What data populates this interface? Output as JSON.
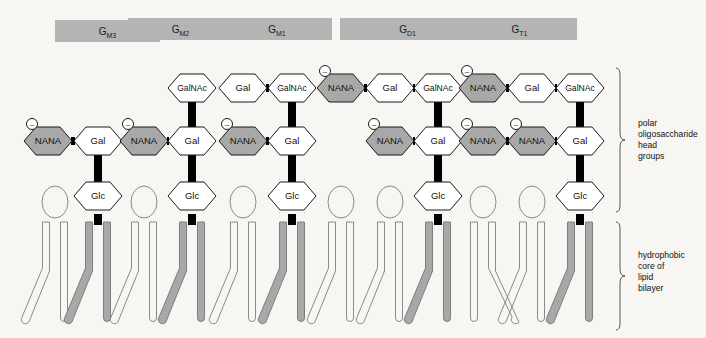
{
  "figure": {
    "background_color": "#f7f6f3"
  },
  "colors": {
    "header_bar_fill": "#b4b4b4",
    "nana_fill": "#a8a8a8",
    "sugar_fill": "#ffffff",
    "outline": "#1a1a1a",
    "bond_fill": "#000000",
    "ganglioside_tail_fill": "#a8a8a8",
    "phospholipid_outline": "#8a8a8a",
    "bracket_color": "#555555"
  },
  "header_bars": [
    {
      "name": "G",
      "subscript": "M3",
      "x": 55,
      "y": 20,
      "width": 105,
      "height": 22
    },
    {
      "name": "G",
      "subscript": "M2",
      "x": 128,
      "y": 18,
      "width": 105,
      "height": 22
    },
    {
      "name": "G",
      "subscript": "M1",
      "x": 222,
      "y": 18,
      "width": 110,
      "height": 22
    },
    {
      "name": "G",
      "subscript": "D1",
      "x": 340,
      "y": 18,
      "width": 135,
      "height": 22
    },
    {
      "name": "G",
      "subscript": "T1",
      "x": 462,
      "y": 18,
      "width": 115,
      "height": 22
    }
  ],
  "sugar_labels": {
    "nana": "NANA",
    "gal": "Gal",
    "galnac": "GalNAc",
    "glc": "Glc"
  },
  "charge_symbol": "–",
  "gangliosides": [
    {
      "id": "GM3",
      "label": "G",
      "subscript": "M3",
      "column_x": 60,
      "residues": [
        {
          "type": "nana",
          "label": "NANA",
          "cx": 48,
          "cy": 141,
          "charged": true
        },
        {
          "type": "gal",
          "label": "Gal",
          "cx": 98,
          "cy": 141,
          "charged": false
        },
        {
          "type": "glc",
          "label": "Glc",
          "cx": 98,
          "cy": 196,
          "charged": false
        }
      ],
      "bonds": [
        {
          "type": "horizontal",
          "x1": 48,
          "y1": 141,
          "x2": 98,
          "y2": 141
        },
        {
          "type": "vertical",
          "x1": 98,
          "y1": 141,
          "x2": 98,
          "y2": 196
        }
      ]
    },
    {
      "id": "GM2",
      "label": "G",
      "subscript": "M2",
      "column_x": 152,
      "residues": [
        {
          "type": "galnac",
          "label": "GalNAc",
          "cx": 192,
          "cy": 88,
          "charged": false
        },
        {
          "type": "nana",
          "label": "NANA",
          "cx": 144,
          "cy": 141,
          "charged": true
        },
        {
          "type": "gal",
          "label": "Gal",
          "cx": 192,
          "cy": 141,
          "charged": false
        },
        {
          "type": "glc",
          "label": "Glc",
          "cx": 192,
          "cy": 196,
          "charged": false
        }
      ],
      "bonds": [
        {
          "type": "vertical",
          "x1": 192,
          "y1": 88,
          "x2": 192,
          "y2": 141
        },
        {
          "type": "horizontal",
          "x1": 144,
          "y1": 141,
          "x2": 192,
          "y2": 141
        },
        {
          "type": "vertical",
          "x1": 192,
          "y1": 141,
          "x2": 192,
          "y2": 196
        }
      ]
    },
    {
      "id": "GM1",
      "label": "G",
      "subscript": "M1",
      "column_x": 245,
      "residues": [
        {
          "type": "gal",
          "label": "Gal",
          "cx": 243,
          "cy": 88,
          "charged": false
        },
        {
          "type": "galnac",
          "label": "GalNAc",
          "cx": 292,
          "cy": 88,
          "charged": false
        },
        {
          "type": "nana",
          "label": "NANA",
          "cx": 243,
          "cy": 141,
          "charged": true
        },
        {
          "type": "gal",
          "label": "Gal",
          "cx": 292,
          "cy": 141,
          "charged": false
        },
        {
          "type": "glc",
          "label": "Glc",
          "cx": 292,
          "cy": 196,
          "charged": false
        }
      ],
      "bonds": [
        {
          "type": "horizontal",
          "x1": 243,
          "y1": 88,
          "x2": 292,
          "y2": 88
        },
        {
          "type": "vertical",
          "x1": 292,
          "y1": 88,
          "x2": 292,
          "y2": 141
        },
        {
          "type": "horizontal",
          "x1": 243,
          "y1": 141,
          "x2": 292,
          "y2": 141
        },
        {
          "type": "vertical",
          "x1": 292,
          "y1": 141,
          "x2": 292,
          "y2": 196
        }
      ]
    },
    {
      "id": "GD1",
      "label": "G",
      "subscript": "D1",
      "column_x": 345,
      "residues": [
        {
          "type": "nana",
          "label": "NANA",
          "cx": 341,
          "cy": 88,
          "charged": true
        },
        {
          "type": "gal",
          "label": "Gal",
          "cx": 390,
          "cy": 88,
          "charged": false
        },
        {
          "type": "galnac",
          "label": "GalNAc",
          "cx": 438,
          "cy": 88,
          "charged": false
        },
        {
          "type": "nana",
          "label": "NANA",
          "cx": 390,
          "cy": 141,
          "charged": true
        },
        {
          "type": "gal",
          "label": "Gal",
          "cx": 438,
          "cy": 141,
          "charged": false
        },
        {
          "type": "glc",
          "label": "Glc",
          "cx": 438,
          "cy": 196,
          "charged": false
        }
      ],
      "bonds": [
        {
          "type": "horizontal",
          "x1": 341,
          "y1": 88,
          "x2": 390,
          "y2": 88
        },
        {
          "type": "horizontal",
          "x1": 390,
          "y1": 88,
          "x2": 438,
          "y2": 88
        },
        {
          "type": "vertical",
          "x1": 438,
          "y1": 88,
          "x2": 438,
          "y2": 141
        },
        {
          "type": "horizontal",
          "x1": 390,
          "y1": 141,
          "x2": 438,
          "y2": 141
        },
        {
          "type": "vertical",
          "x1": 438,
          "y1": 141,
          "x2": 438,
          "y2": 196
        }
      ]
    },
    {
      "id": "GT1",
      "label": "G",
      "subscript": "T1",
      "column_x": 465,
      "residues": [
        {
          "type": "nana",
          "label": "NANA",
          "cx": 483,
          "cy": 88,
          "charged": true
        },
        {
          "type": "gal",
          "label": "Gal",
          "cx": 532,
          "cy": 88,
          "charged": false
        },
        {
          "type": "galnac",
          "label": "GalNAc",
          "cx": 580,
          "cy": 88,
          "charged": false
        },
        {
          "type": "nana",
          "label": "NANA",
          "cx": 483,
          "cy": 141,
          "charged": true
        },
        {
          "type": "nana",
          "label": "NANA",
          "cx": 532,
          "cy": 141,
          "charged": true
        },
        {
          "type": "gal",
          "label": "Gal",
          "cx": 580,
          "cy": 141,
          "charged": false
        },
        {
          "type": "glc",
          "label": "Glc",
          "cx": 580,
          "cy": 196,
          "charged": false
        }
      ],
      "bonds": [
        {
          "type": "horizontal",
          "x1": 483,
          "y1": 88,
          "x2": 532,
          "y2": 88
        },
        {
          "type": "horizontal",
          "x1": 532,
          "y1": 88,
          "x2": 580,
          "y2": 88
        },
        {
          "type": "vertical",
          "x1": 580,
          "y1": 88,
          "x2": 580,
          "y2": 141
        },
        {
          "type": "horizontal",
          "x1": 483,
          "y1": 141,
          "x2": 532,
          "y2": 141
        },
        {
          "type": "horizontal",
          "x1": 532,
          "y1": 141,
          "x2": 580,
          "y2": 141
        },
        {
          "type": "vertical",
          "x1": 580,
          "y1": 141,
          "x2": 580,
          "y2": 196
        }
      ]
    }
  ],
  "lipids": [
    {
      "cx": 55,
      "type": "phospholipid",
      "flip": false
    },
    {
      "cx": 98,
      "type": "ganglioside",
      "flip": false
    },
    {
      "cx": 144,
      "type": "phospholipid",
      "flip": false
    },
    {
      "cx": 192,
      "type": "ganglioside",
      "flip": false
    },
    {
      "cx": 243,
      "type": "phospholipid",
      "flip": false
    },
    {
      "cx": 292,
      "type": "ganglioside",
      "flip": false
    },
    {
      "cx": 341,
      "type": "phospholipid",
      "flip": false
    },
    {
      "cx": 390,
      "type": "phospholipid",
      "flip": false
    },
    {
      "cx": 438,
      "type": "ganglioside",
      "flip": false
    },
    {
      "cx": 483,
      "type": "phospholipid",
      "flip": true
    },
    {
      "cx": 532,
      "type": "phospholipid",
      "flip": false
    },
    {
      "cx": 580,
      "type": "ganglioside",
      "flip": false
    }
  ],
  "annotations": [
    {
      "id": "polar-head-groups",
      "lines": [
        "polar",
        "oligosaccharide",
        "head",
        "groups"
      ],
      "bracket": {
        "x": 620,
        "y_top": 68,
        "y_bottom": 212
      },
      "text_x": 638,
      "text_y": 126
    },
    {
      "id": "hydrophobic-core",
      "lines": [
        "hydrophobic",
        "core of",
        "lipid",
        "bilayer"
      ],
      "bracket": {
        "x": 620,
        "y_top": 222,
        "y_bottom": 330
      },
      "text_x": 638,
      "text_y": 258
    }
  ]
}
